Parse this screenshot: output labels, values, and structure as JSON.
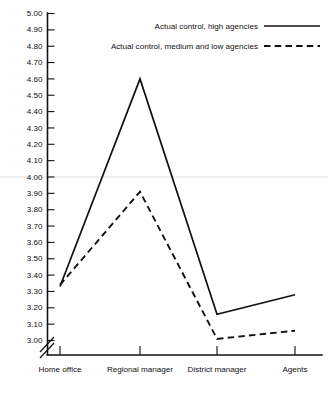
{
  "chart_data": {
    "type": "line",
    "title": "",
    "xlabel": "",
    "ylabel": "",
    "categories": [
      "Home office",
      "Regional manager",
      "District manager",
      "Agents"
    ],
    "series": [
      {
        "name": "Actual control, high agencies",
        "style": "solid",
        "color": "#111111",
        "values": [
          3.33,
          4.6,
          3.16,
          3.28
        ]
      },
      {
        "name": "Actual control, medium and low agencies",
        "style": "dashed",
        "color": "#111111",
        "values": [
          3.34,
          3.91,
          3.01,
          3.06
        ]
      }
    ],
    "ylim": [
      3.0,
      5.0
    ],
    "ytick_step": 0.1,
    "ytick_labels": [
      "5.00",
      "4.90",
      "4.80",
      "4.70",
      "4.60",
      "4.50",
      "4.40",
      "4.30",
      "4.20",
      "4.10",
      "4.00",
      "3.90",
      "3.80",
      "3.70",
      "3.60",
      "3.50",
      "3.40",
      "3.30",
      "3.20",
      "3.10",
      "3.00"
    ],
    "grid": {
      "horizontal_at": [
        4.0
      ],
      "color": "#e2e2e2"
    },
    "axis_break": true,
    "legend_position": "top-right"
  },
  "legend": {
    "items": [
      {
        "label": "Actual control, high agencies",
        "style": "solid"
      },
      {
        "label": "Actual control, medium and low agencies",
        "style": "dashed"
      }
    ]
  }
}
